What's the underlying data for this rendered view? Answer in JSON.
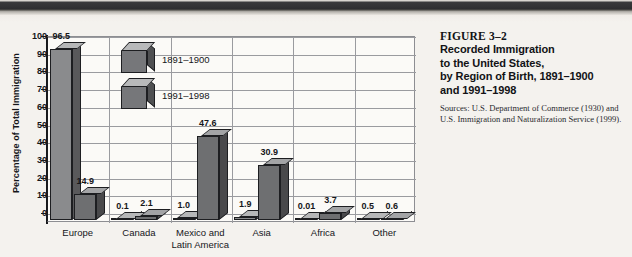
{
  "figure": {
    "number": "FIGURE 3–2",
    "title_lines": [
      "Recorded Immigration",
      "to the United States,",
      "by Region of Birth, 1891–1900",
      "and 1991–1998"
    ],
    "sources": "Sources: U.S. Department of Commerce (1930) and U.S. Immigration and Naturalization Service (1999)."
  },
  "chart_data": {
    "type": "bar",
    "xlabel": "",
    "ylabel": "Percentage of Total Immigration",
    "ylim": [
      0,
      100
    ],
    "ytick_step": 10,
    "yticks": [
      "100",
      "90",
      "80",
      "70",
      "60",
      "50",
      "40",
      "30",
      "20",
      "10",
      "0"
    ],
    "grid": true,
    "legend_position": "inside-top-left",
    "style": "3d-grouped-columns",
    "categories": [
      "Europe",
      "Canada",
      "Mexico and Latin America",
      "Asia",
      "Africa",
      "Other"
    ],
    "category_label_lines": [
      [
        "Europe"
      ],
      [
        "Canada"
      ],
      [
        "Mexico and",
        "Latin America"
      ],
      [
        "Asia"
      ],
      [
        "Africa"
      ],
      [
        "Other"
      ]
    ],
    "series": [
      {
        "name": "1891–1900",
        "color": "#8a8b8d",
        "values": [
          96.5,
          0.1,
          1.0,
          1.9,
          0.01,
          0.5
        ],
        "labels": [
          "96.5",
          "0.1",
          "1.0",
          "1.9",
          "0.01",
          "0.5"
        ]
      },
      {
        "name": "1991–1998",
        "color": "#6e6f71",
        "values": [
          14.9,
          2.1,
          47.6,
          30.9,
          3.7,
          0.6
        ],
        "labels": [
          "14.9",
          "2.1",
          "47.6",
          "30.9",
          "3.7",
          "0.6"
        ]
      }
    ]
  }
}
